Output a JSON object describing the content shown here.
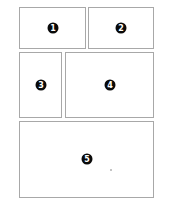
{
  "layout": {
    "panels": [
      {
        "id": "1",
        "label": "1"
      },
      {
        "id": "2",
        "label": "2"
      },
      {
        "id": "3",
        "label": "3"
      },
      {
        "id": "4",
        "label": "4"
      },
      {
        "id": "5",
        "label": "5"
      }
    ]
  },
  "colors": {
    "border": "#a8a8a8",
    "badge": "#0a0a0a",
    "background": "#ffffff"
  }
}
